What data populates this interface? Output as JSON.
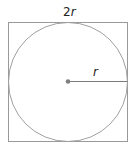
{
  "diagram": {
    "type": "circle inscribed in square",
    "top_label_num": "2",
    "top_label_var": "r",
    "radius_label": "r",
    "colors": {
      "square": "#9a9a9a",
      "circle": "#a0a0a0",
      "radius_line": "#7a7a7a",
      "center_dot": "#808080"
    }
  }
}
